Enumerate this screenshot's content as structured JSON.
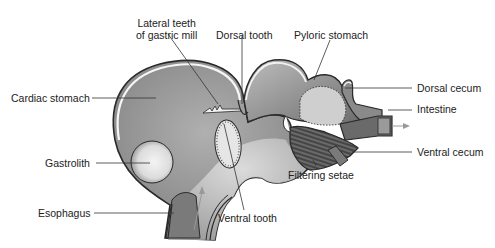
{
  "diagram": {
    "labels": {
      "lateral_teeth_line1": "Lateral teeth",
      "lateral_teeth_line2": "of gastric mill",
      "dorsal_tooth": "Dorsal tooth",
      "pyloric_stomach": "Pyloric stomach",
      "cardiac_stomach": "Cardiac stomach",
      "dorsal_cecum": "Dorsal cecum",
      "intestine": "Intestine",
      "gastrolith": "Gastrolith",
      "ventral_cecum": "Ventral cecum",
      "filtering_setae": "Filtering setae",
      "esophagus": "Esophagus",
      "ventral_tooth": "Ventral tooth"
    },
    "colors": {
      "outline": "#2a2a2a",
      "wall_fill": "#f4f4f4",
      "cardiac_fill": "#9a9a9a",
      "pyloric_fill": "#8a8a8a",
      "light_fill": "#d8d8d8",
      "leader_line": "#333333",
      "arrow": "#999999"
    }
  }
}
